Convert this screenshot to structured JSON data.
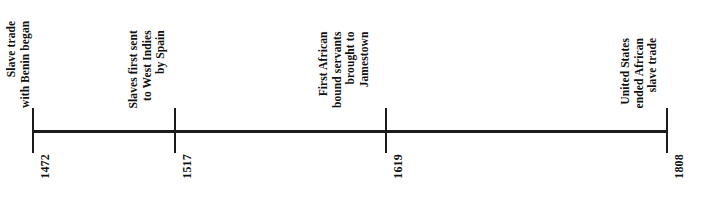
{
  "figure": {
    "type": "timeline",
    "orientation": "horizontal",
    "background_color": "#ffffff",
    "axis_color": "#1c1c1c",
    "text_color": "#111111"
  },
  "chart_data": {
    "type": "timeline",
    "title": "",
    "xlabel": "",
    "ylabel": "",
    "axis_start_year": 1472,
    "axis_end_year": 1808,
    "events": [
      {
        "year": "1472",
        "label_lines": [
          "Slave trade",
          "with Benin began"
        ],
        "x_px": 32
      },
      {
        "year": "1517",
        "label_lines": [
          "Slaves first sent",
          "to West Indies",
          "by Spain"
        ],
        "x_px": 174
      },
      {
        "year": "1619",
        "label_lines": [
          "First African",
          "bound servants",
          "brought to",
          "Jamestown"
        ],
        "x_px": 385
      },
      {
        "year": "1808",
        "label_lines": [
          "United States",
          "ended African",
          "slave trade"
        ],
        "x_px": 666
      }
    ]
  }
}
